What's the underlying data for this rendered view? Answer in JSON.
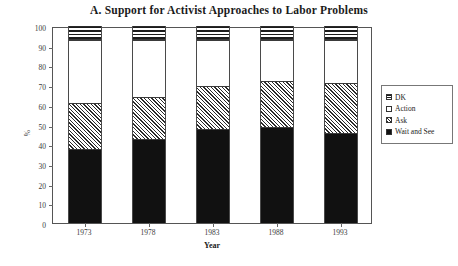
{
  "chart_data": {
    "type": "bar",
    "stacked": true,
    "title": "A. Support for Activist Approaches to Labor Problems",
    "xlabel": "Year",
    "ylabel": "%",
    "categories": [
      "1973",
      "1978",
      "1983",
      "1988",
      "1993"
    ],
    "ylim": [
      0,
      100
    ],
    "yticks": [
      0,
      10,
      20,
      30,
      40,
      50,
      60,
      70,
      80,
      90,
      100
    ],
    "ytick_labels": [
      "0",
      "10",
      "20",
      "30",
      "40",
      "50",
      "60",
      "70",
      "80",
      "90",
      "100"
    ],
    "grid": false,
    "legend_position": "right",
    "series": [
      {
        "name": "Wait and See",
        "pattern": "solid-black",
        "values": [
          37,
          42,
          47,
          48,
          45
        ]
      },
      {
        "name": "Ask",
        "pattern": "diagonal-hatch",
        "values": [
          24,
          22,
          22.5,
          24,
          26
        ]
      },
      {
        "name": "Action",
        "pattern": "white",
        "values": [
          32,
          29,
          23.5,
          21,
          22
        ]
      },
      {
        "name": "DK",
        "pattern": "horizontal-stripes",
        "values": [
          7,
          7,
          7,
          7,
          7
        ]
      }
    ],
    "cumulative_tops": {
      "wait_and_see": [
        37,
        42,
        47,
        48,
        45
      ],
      "ask": [
        61,
        64,
        69.5,
        72,
        71
      ],
      "action": [
        93,
        93,
        93,
        93,
        93
      ],
      "dk": [
        100,
        100,
        100,
        100,
        100
      ]
    },
    "legend_entries": [
      "DK",
      "Action",
      "Ask",
      "Wait and See"
    ]
  }
}
